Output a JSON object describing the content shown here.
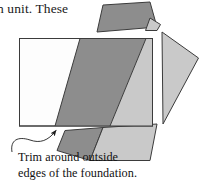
{
  "figure": {
    "running_text": "n unit. These",
    "caption": {
      "line1": "Trim around outside",
      "line2": "edges of the foundation."
    },
    "colors": {
      "background": "#ffffff",
      "outline": "#3b3b3b",
      "foundation_fill": "#fdfdfd",
      "fabric_dark": "#8d8d8d",
      "fabric_light": "#c9c9c9",
      "fabric_mid": "#a8a8a8",
      "leader_line": "#2b2b2b",
      "text": "#1a1a1a"
    },
    "shapes": [
      {
        "name": "foundation-rectangle",
        "role": "foundation square outline",
        "fill": "#fdfdfd",
        "points": "19,38 153,38 153,126 19,126"
      },
      {
        "name": "fabric-strip-dark",
        "role": "dark fabric strip over foundation",
        "fill": "#8d8d8d",
        "points": "80,38 146,38 110,126 55,126"
      },
      {
        "name": "fabric-strip-light",
        "role": "light fabric strip over foundation",
        "fill": "#c9c9c9",
        "points": "146,38 153,38 153,126 110,126"
      },
      {
        "name": "trimmed-piece-top",
        "role": "trimmed scrap above foundation",
        "fill": "#8d8d8d",
        "points": "103,5 150,2 157,27 97,32"
      },
      {
        "name": "trimmed-corner-top-right",
        "role": "small light scrap at top right",
        "fill": "#c9c9c9",
        "points": "150,18 160,24 157,30 146,30"
      },
      {
        "name": "trimmed-piece-right",
        "role": "trimmed wedge right of foundation",
        "fill": "#c9c9c9",
        "points": "162,32 198,58 163,124"
      },
      {
        "name": "trimmed-piece-bottom-dark",
        "role": "dark trimmed scrap below foundation",
        "fill": "#8d8d8d",
        "points": "65,130 103,127 90,160 57,150"
      },
      {
        "name": "trimmed-piece-bottom-light",
        "role": "light trimmed scrap below foundation",
        "fill": "#c9c9c9",
        "points": "103,127 157,124 150,160 90,160"
      }
    ],
    "annotation": {
      "name": "trim-leader-arrow",
      "role": "curved leader line with arrowhead pointing to foundation edge",
      "arrow_tip": "58,127"
    }
  }
}
